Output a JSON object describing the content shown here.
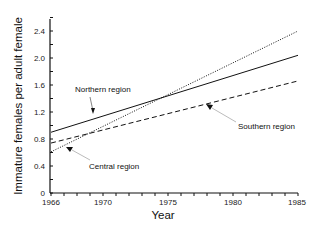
{
  "chart_data": {
    "type": "line",
    "title": "",
    "xlabel": "Year",
    "ylabel": "Immature females per adult female",
    "xlim": [
      1966,
      1985
    ],
    "ylim": [
      0,
      2.6
    ],
    "grid": false,
    "x_ticks": [
      "1966",
      "1970",
      "1975",
      "1980",
      "1985"
    ],
    "y_ticks": [
      "0",
      "0.4",
      "0.8",
      "1.2",
      "1.6",
      "2.0",
      "2.4"
    ],
    "series": [
      {
        "name": "Northern region",
        "style": "solid",
        "x": [
          1966,
          1985
        ],
        "values": [
          0.9,
          2.04
        ]
      },
      {
        "name": "Southern region",
        "style": "dashed",
        "x": [
          1966,
          1985
        ],
        "values": [
          0.74,
          1.66
        ]
      },
      {
        "name": "Central region",
        "style": "dotted",
        "x": [
          1966,
          1985
        ],
        "values": [
          0.61,
          2.4
        ]
      }
    ],
    "annotations": [
      {
        "text": "Northern region",
        "target": "Northern region"
      },
      {
        "text": "Southern region",
        "target": "Southern region"
      },
      {
        "text": "Central region",
        "target": "Central region"
      }
    ]
  },
  "labels": {
    "xlabel": "Year",
    "ylabel": "Immature females per adult female",
    "x_ticks": [
      "1966",
      "1970",
      "1975",
      "1980",
      "1985"
    ],
    "y_ticks": [
      "0",
      "0.4",
      "0.8",
      "1.2",
      "1.6",
      "2.0",
      "2.4"
    ],
    "annot_north": "Northern region",
    "annot_south": "Southern region",
    "annot_central": "Central region"
  }
}
